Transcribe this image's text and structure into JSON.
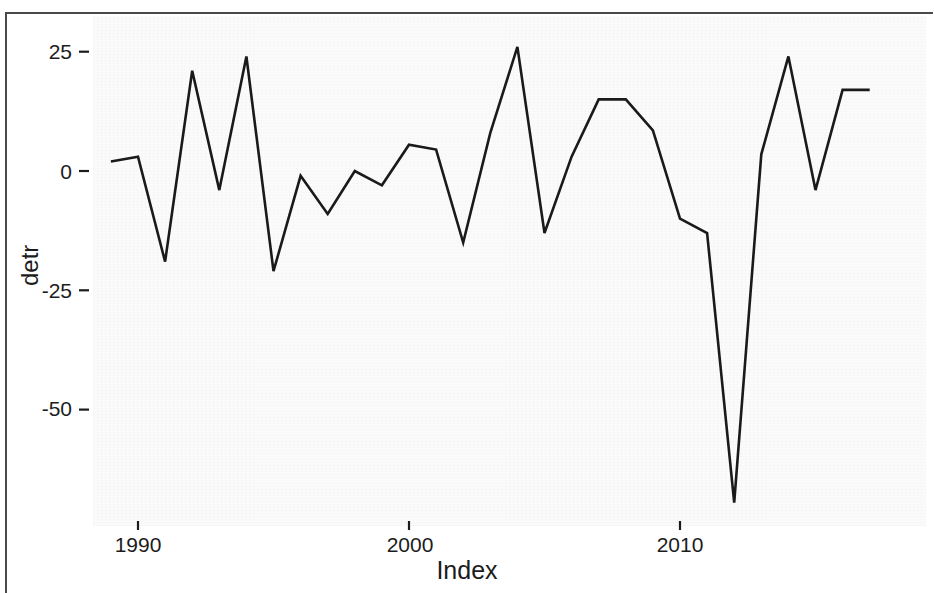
{
  "figure": {
    "background_color": "#ffffff",
    "panel_color": "#fbfbfb",
    "line_color": "#1a1a1a"
  },
  "axes": {
    "y_title": "detr",
    "x_title": "Index",
    "y_ticks": [
      "25",
      "0",
      "-25",
      "-50"
    ],
    "x_ticks": [
      "1990",
      "2000",
      "2010"
    ]
  },
  "chart_data": {
    "type": "line",
    "title": "",
    "xlabel": "Index",
    "ylabel": "detr",
    "x": [
      1989,
      1990,
      1991,
      1992,
      1993,
      1994,
      1995,
      1996,
      1997,
      1998,
      1999,
      2000,
      2001,
      2002,
      2003,
      2004,
      2005,
      2006,
      2007,
      2008,
      2009,
      2010,
      2011,
      2012,
      2013,
      2014,
      2015,
      2016,
      2017
    ],
    "values": [
      2,
      3,
      -19,
      21,
      -4,
      24,
      -21,
      -1,
      -9,
      0,
      -3,
      5.5,
      4.5,
      -15,
      8,
      26,
      -13,
      3,
      15,
      15,
      8.5,
      -10,
      -13,
      -69.5,
      3.5,
      24,
      -4,
      17,
      17
    ],
    "series": [
      {
        "name": "detr",
        "values": [
          2,
          3,
          -19,
          21,
          -4,
          24,
          -21,
          -1,
          -9,
          0,
          -3,
          5.5,
          4.5,
          -15,
          8,
          26,
          -13,
          3,
          15,
          15,
          8.5,
          -10,
          -13,
          -69.5,
          3.5,
          24,
          -4,
          17,
          17
        ]
      }
    ],
    "xlim": [
      1988.3,
      2018.8
    ],
    "ylim": [
      -76,
      32
    ],
    "y_tick_values": [
      25,
      0,
      -25,
      -50
    ],
    "x_tick_values": [
      1990,
      2000,
      2010
    ],
    "grid": false,
    "legend": null,
    "line_color": "#1a1a1a",
    "line_width": 2.6
  }
}
